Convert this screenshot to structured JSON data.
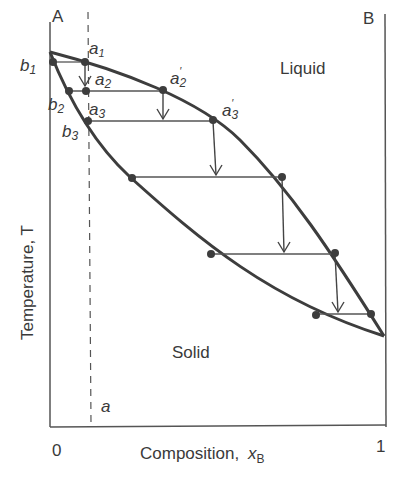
{
  "diagram": {
    "type": "phase-diagram",
    "components": {
      "left": "A",
      "right": "B"
    },
    "regions": {
      "upper": "Liquid",
      "lower": "Solid"
    },
    "axes": {
      "y_label": "Temperature, T",
      "x_label_prefix": "Composition, ",
      "x_label_var": "x",
      "x_label_sub": "B",
      "x_ticks": [
        "0",
        "1"
      ]
    },
    "isopleth_label": "a",
    "points": {
      "a1": {
        "base": "a",
        "sub": "1",
        "prime": false
      },
      "a2": {
        "base": "a",
        "sub": "2",
        "prime": false
      },
      "a3": {
        "base": "a",
        "sub": "3",
        "prime": false
      },
      "a2p": {
        "base": "a",
        "sub": "2",
        "prime": true
      },
      "a3p": {
        "base": "a",
        "sub": "3",
        "prime": true
      },
      "b1": {
        "base": "b",
        "sub": "1"
      },
      "b2": {
        "base": "b",
        "sub": "2"
      },
      "b3": {
        "base": "b",
        "sub": "3"
      }
    },
    "colors": {
      "curve": "#3d3d3d",
      "line": "#505050",
      "text": "#3a3a3a"
    }
  }
}
